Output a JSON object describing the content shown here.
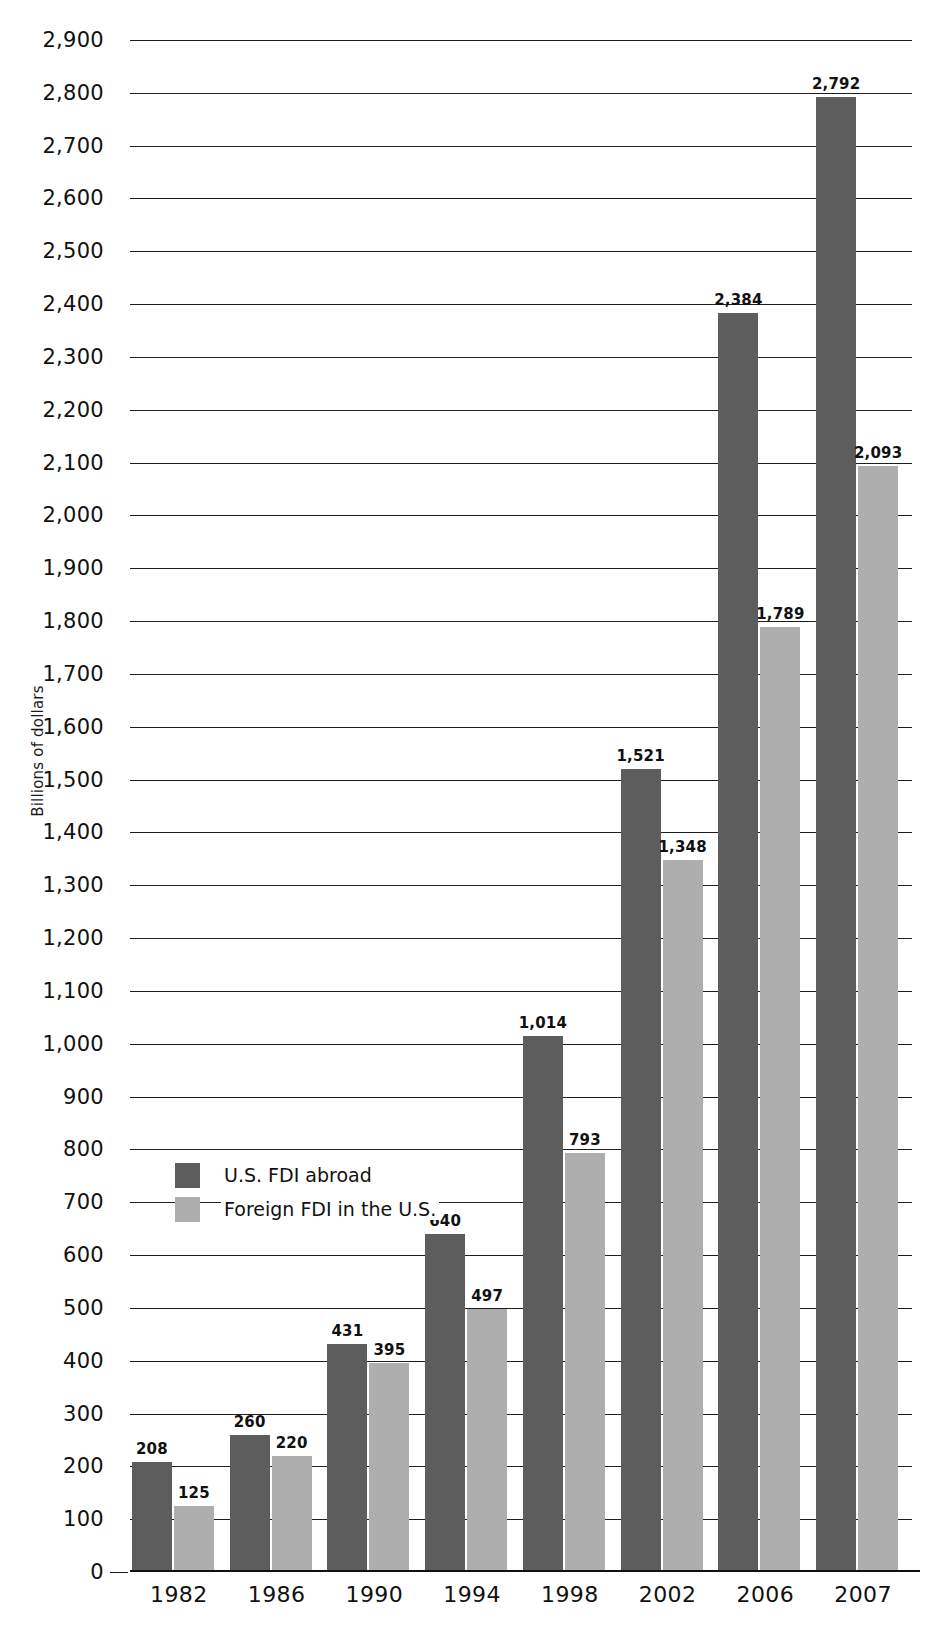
{
  "chart_data": {
    "type": "bar",
    "title": "",
    "xlabel": "",
    "ylabel": "Billions of dollars",
    "ylim": [
      0,
      2900
    ],
    "ytick_step": 100,
    "grid": true,
    "legend_position": "inside-left",
    "categories": [
      "1982",
      "1986",
      "1990",
      "1994",
      "1998",
      "2002",
      "2006",
      "2007"
    ],
    "ytick_labels": [
      "0",
      "100",
      "200",
      "300",
      "400",
      "500",
      "600",
      "700",
      "800",
      "900",
      "1,000",
      "1,100",
      "1,200",
      "1,300",
      "1,400",
      "1,500",
      "1,600",
      "1,700",
      "1,800",
      "1,900",
      "2,000",
      "2,100",
      "2,200",
      "2,300",
      "2,400",
      "2,500",
      "2,600",
      "2,700",
      "2,800",
      "2,900"
    ],
    "series": [
      {
        "name": "U.S. FDI abroad",
        "color": "#5d5d5d",
        "values": [
          208,
          260,
          431,
          640,
          1014,
          1521,
          2384,
          2792
        ],
        "value_labels": [
          "208",
          "260",
          "431",
          "640",
          "1,014",
          "1,521",
          "2,384",
          "2,792"
        ]
      },
      {
        "name": "Foreign FDI in the U.S.",
        "color": "#aeaeae",
        "values": [
          125,
          220,
          395,
          497,
          793,
          1348,
          1789,
          2093
        ],
        "value_labels": [
          "125",
          "220",
          "395",
          "497",
          "793",
          "1,348",
          "1,789",
          "2,093"
        ]
      }
    ]
  },
  "legend": {
    "items": [
      {
        "label": "U.S. FDI abroad",
        "swatch": "dark"
      },
      {
        "label": "Foreign FDI in the U.S.",
        "swatch": "light"
      }
    ]
  },
  "colors": {
    "series_dark": "#5d5d5d",
    "series_light": "#aeaeae",
    "axis": "#111111",
    "background": "#ffffff"
  }
}
